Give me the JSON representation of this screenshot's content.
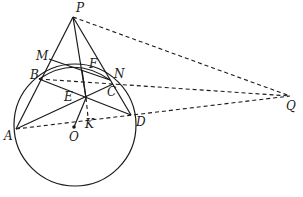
{
  "diagram": {
    "type": "geometry",
    "circle": {
      "center": "O",
      "cx": 75,
      "cy": 125,
      "r": 61
    },
    "points": {
      "P": {
        "x": 73,
        "y": 17,
        "label": "P",
        "lx": 76,
        "ly": 12
      },
      "M": {
        "x": 49,
        "y": 59,
        "label": "M",
        "lx": 36,
        "ly": 60
      },
      "B": {
        "x": 39,
        "y": 79,
        "label": "B",
        "lx": 30,
        "ly": 79
      },
      "F": {
        "x": 82,
        "y": 70,
        "label": "F",
        "lx": 89,
        "ly": 68
      },
      "N": {
        "x": 110,
        "y": 80,
        "label": "N",
        "lx": 114,
        "ly": 78
      },
      "C": {
        "x": 113,
        "y": 84,
        "label": "C",
        "lx": 107,
        "ly": 96
      },
      "E": {
        "x": 86,
        "y": 98,
        "label": "E",
        "lx": 64,
        "ly": 101
      },
      "K": {
        "x": 88,
        "y": 117,
        "label": "K",
        "lx": 85,
        "ly": 128
      },
      "A": {
        "x": 16,
        "y": 129,
        "label": "A",
        "lx": 4,
        "ly": 140
      },
      "D": {
        "x": 131,
        "y": 115,
        "label": "D",
        "lx": 136,
        "ly": 126
      },
      "O": {
        "x": 74,
        "y": 127,
        "label": "O",
        "lx": 69,
        "ly": 141
      },
      "Q": {
        "x": 290,
        "y": 96,
        "label": "Q",
        "lx": 286,
        "ly": 110
      }
    },
    "solid_segments": [
      [
        "P",
        "A"
      ],
      [
        "P",
        "D"
      ],
      [
        "P",
        "E"
      ],
      [
        "M",
        "N"
      ],
      [
        "B",
        "D"
      ],
      [
        "A",
        "C"
      ],
      [
        "E",
        "F"
      ],
      [
        "E",
        "O"
      ]
    ],
    "dashed_segments": [
      [
        "P",
        "Q"
      ],
      [
        "B",
        "Q"
      ],
      [
        "A",
        "Q"
      ],
      [
        "E",
        "K"
      ]
    ],
    "arc": {
      "from": "B",
      "to": "N",
      "note": "arc of circle through F region"
    }
  }
}
